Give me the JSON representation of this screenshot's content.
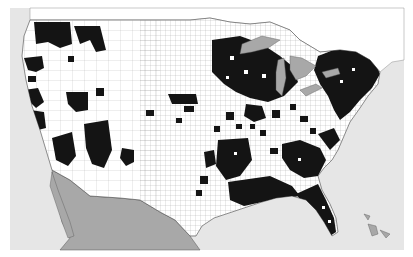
{
  "map": {
    "subject": "United States county map with highlighted (black) counties",
    "colors": {
      "page_background": "#ffffff",
      "ocean": "#e6e6e6",
      "us_land": "#ffffff",
      "highlighted_county": "#141414",
      "foreign_land": "#a8a8a8",
      "lakes": "#a8a8a8",
      "county_border": "#555555",
      "canada_land": "#ffffff"
    },
    "regions_highlighted": [
      "Western Washington",
      "Northern Idaho / NE Washington",
      "Western Oregon coast",
      "Northern California coast",
      "Central/Southern California",
      "Nevada (Clark area)",
      "Arizona (central/south)",
      "Southern New Mexico",
      "Colorado front range",
      "Upper Midwest (Minnesota, Wisconsin, Michigan)",
      "Northeast (New England, New York, Pennsylvania)",
      "Gulf Coast (Louisiana, Mississippi, Alabama)",
      "Florida",
      "Atlantic Coastal Plain (Georgia, Carolinas)",
      "Scattered Midwest and Southern counties"
    ]
  }
}
